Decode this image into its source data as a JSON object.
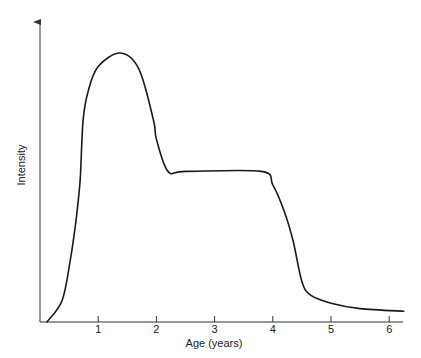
{
  "chart_data": {
    "type": "line",
    "title": "",
    "xlabel": "Age (years)",
    "ylabel": "Intensity",
    "xlim": [
      0,
      6.25
    ],
    "ylim": [
      0,
      100
    ],
    "x_ticks": [
      "1",
      "2",
      "3",
      "4",
      "5",
      "6"
    ],
    "y_ticks": [],
    "grid": false,
    "legend": null,
    "series": [
      {
        "name": "Intensity",
        "x": [
          0.12,
          0.38,
          0.52,
          0.62,
          0.69,
          0.74,
          0.83,
          1.0,
          1.38,
          1.7,
          1.95,
          2.0,
          2.2,
          2.5,
          3.8,
          4.0,
          4.2,
          4.35,
          4.5,
          4.65,
          5.0,
          5.5,
          6.25
        ],
        "values": [
          0,
          8,
          23,
          38,
          53,
          75,
          86,
          95,
          100,
          94,
          75,
          68,
          56,
          56,
          56,
          51,
          41,
          30,
          15,
          10,
          7,
          5,
          4
        ]
      }
    ],
    "colors": {
      "line": "#1a1a1a",
      "axis": "#333333"
    }
  }
}
